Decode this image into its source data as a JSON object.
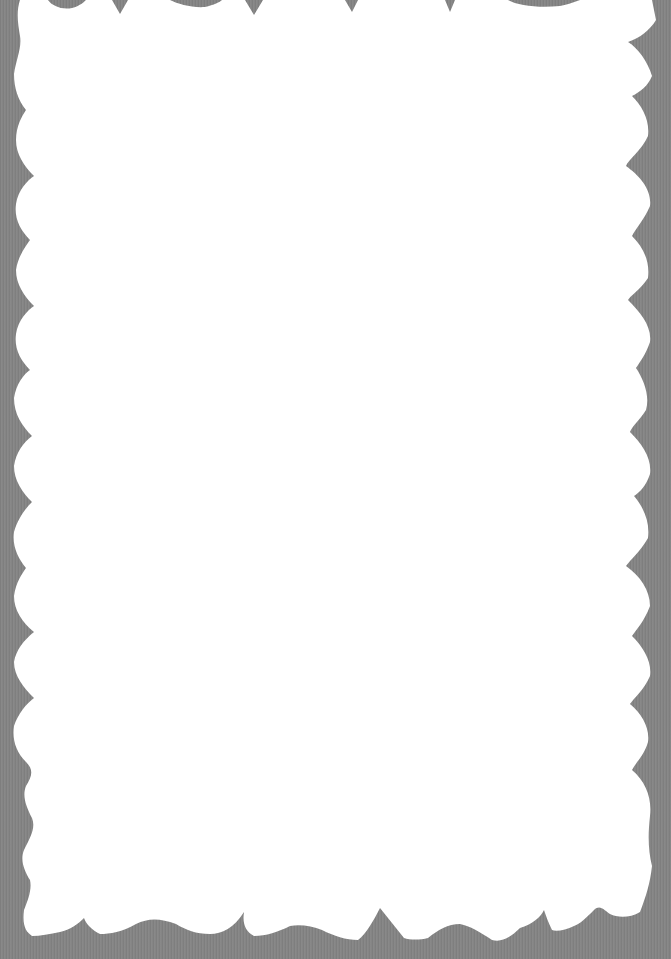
{
  "scene": {
    "description": "White paper cutout with scalloped wavy edges on a gray textured background",
    "subject": "scalloped-paper-border-frame",
    "text_content": "",
    "colors": {
      "background": "#858585",
      "paper": "#ffffff"
    }
  }
}
